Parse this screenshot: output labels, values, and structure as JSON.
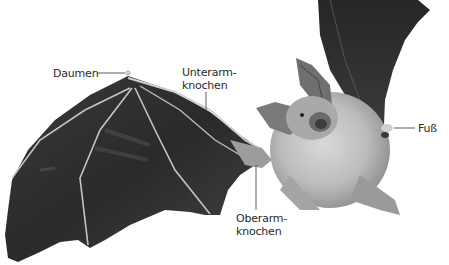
{
  "figure": {
    "background": "#ffffff",
    "labels": {
      "daumen": "Daumen",
      "unterarm_line1": "Unterarm-",
      "unterarm_line2": "knochen",
      "oberarm_line1": "Oberarm-",
      "oberarm_line2": "knochen",
      "fuss": "Fuß"
    },
    "colors": {
      "wing_membrane": "#2b2b2b",
      "wing_bones": "#c8c8c8",
      "body_fur": "#bdbdbd",
      "label_text": "#2a2a2a",
      "leader_line": "#333333"
    }
  }
}
